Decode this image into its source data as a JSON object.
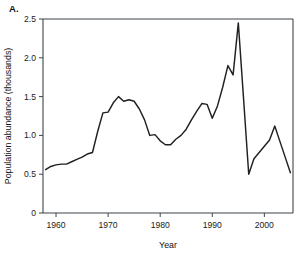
{
  "panel": {
    "label": "A."
  },
  "chart_data": {
    "type": "line",
    "title": "",
    "xlabel": "Year",
    "ylabel": "Population abundance (thousands)",
    "xlim": [
      1957.5,
      2005.5
    ],
    "ylim": [
      0,
      2.5
    ],
    "xticks": [
      1960,
      1970,
      1980,
      1990,
      2000
    ],
    "xtick_labels": [
      "1960",
      "1970",
      "1980",
      "1990",
      "2000"
    ],
    "yticks": [
      0,
      0.5,
      1.0,
      1.5,
      2.0,
      2.5
    ],
    "ytick_labels": [
      "0",
      "0.5",
      "1.0",
      "1.5",
      "2.0",
      "2.5"
    ],
    "grid": false,
    "legend": "none",
    "series": [
      {
        "name": "Population abundance",
        "color": "#231f20",
        "x": [
          1958,
          1959,
          1960,
          1961,
          1962,
          1963,
          1964,
          1965,
          1966,
          1967,
          1968,
          1969,
          1970,
          1971,
          1972,
          1973,
          1974,
          1975,
          1976,
          1977,
          1978,
          1979,
          1980,
          1981,
          1982,
          1983,
          1984,
          1985,
          1986,
          1987,
          1988,
          1989,
          1990,
          1991,
          1992,
          1993,
          1994,
          1995,
          1996,
          1997,
          1998,
          1999,
          2000,
          2001,
          2002,
          2003,
          2004,
          2005
        ],
        "y": [
          0.56,
          0.6,
          0.62,
          0.63,
          0.63,
          0.66,
          0.69,
          0.72,
          0.76,
          0.78,
          1.05,
          1.29,
          1.3,
          1.42,
          1.5,
          1.44,
          1.46,
          1.44,
          1.34,
          1.2,
          1.0,
          1.01,
          0.93,
          0.88,
          0.88,
          0.95,
          1.0,
          1.08,
          1.2,
          1.31,
          1.41,
          1.4,
          1.22,
          1.38,
          1.62,
          1.9,
          1.78,
          2.45,
          1.48,
          0.5,
          0.7,
          0.78,
          0.86,
          0.94,
          1.12,
          0.92,
          0.72,
          0.52
        ]
      }
    ]
  }
}
